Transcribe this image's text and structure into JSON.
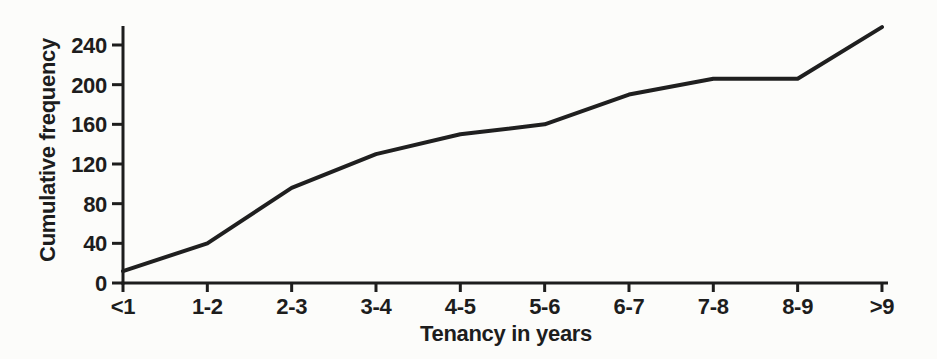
{
  "chart_data": {
    "type": "line",
    "title": "",
    "xlabel": "Tenancy in years",
    "ylabel": "Cumulative frequency",
    "categories": [
      "<1",
      "1-2",
      "2-3",
      "3-4",
      "4-5",
      "5-6",
      "6-7",
      "7-8",
      "8-9",
      ">9"
    ],
    "values": [
      12,
      40,
      96,
      130,
      150,
      160,
      190,
      206,
      206,
      258
    ],
    "yticks": [
      0,
      40,
      80,
      120,
      160,
      200,
      240
    ],
    "ylim": [
      0,
      260
    ],
    "grid": false,
    "legend": "none",
    "series_name": "Cumulative frequency of tenancy",
    "line_color": "#1f1f1f",
    "axis_color": "#1d1d1d",
    "background": "#fcfcfa"
  }
}
